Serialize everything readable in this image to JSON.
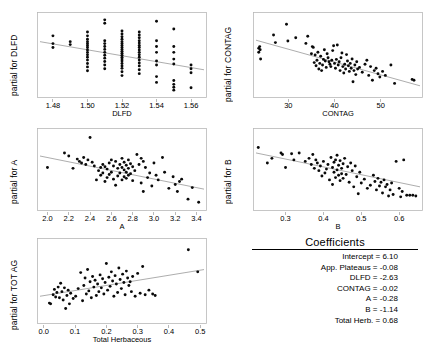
{
  "figure": {
    "width": 428,
    "height": 356,
    "background": "#ffffff",
    "point_color": "#0a0a0a",
    "line_color": "#8a8a8a",
    "frame_color": "#b9b9b9"
  },
  "coefficients": {
    "title": "Coefficients",
    "rows": [
      {
        "label": "Intercept = 6.10"
      },
      {
        "label": "App. Plateaus = -0.08"
      },
      {
        "label": "DLFD = -2.63"
      },
      {
        "label": "CONTAG = -0.02"
      },
      {
        "label": "A = -0.28"
      },
      {
        "label": "B = -1.14"
      },
      {
        "label": "Total Herb. = 0.68"
      }
    ]
  },
  "chart_data": [
    {
      "id": "dlfd",
      "type": "scatter",
      "title": "",
      "ylabel": "partial for DLFD",
      "xlabel": "DLFD",
      "xlim": [
        1.4725,
        1.5675
      ],
      "ylim": [
        -0.6,
        1.05
      ],
      "xticks": [
        1.48,
        1.5,
        1.52,
        1.54,
        1.56
      ],
      "xticklabels": [
        "1.48",
        "1.50",
        "1.52",
        "1.54",
        "1.56"
      ],
      "yticks": [],
      "yticklabels": [],
      "grid": false,
      "legend": "none",
      "fit": {
        "x": [
          1.4725,
          1.5675
        ],
        "y": [
          0.5,
          -0.08
        ]
      },
      "x": [
        1.48,
        1.48,
        1.48,
        1.49,
        1.49,
        1.5,
        1.5,
        1.5,
        1.5,
        1.5,
        1.5,
        1.5,
        1.5,
        1.5,
        1.5,
        1.5,
        1.5,
        1.5,
        1.5,
        1.5,
        1.51,
        1.51,
        1.51,
        1.51,
        1.51,
        1.51,
        1.51,
        1.51,
        1.51,
        1.51,
        1.51,
        1.51,
        1.52,
        1.52,
        1.52,
        1.52,
        1.52,
        1.52,
        1.52,
        1.52,
        1.52,
        1.52,
        1.52,
        1.52,
        1.52,
        1.52,
        1.52,
        1.52,
        1.52,
        1.52,
        1.52,
        1.52,
        1.53,
        1.53,
        1.53,
        1.53,
        1.53,
        1.53,
        1.53,
        1.53,
        1.53,
        1.53,
        1.53,
        1.53,
        1.53,
        1.53,
        1.53,
        1.53,
        1.54,
        1.54,
        1.54,
        1.54,
        1.54,
        1.54,
        1.54,
        1.54,
        1.55,
        1.55,
        1.55,
        1.55,
        1.55,
        1.55,
        1.55,
        1.55,
        1.55,
        1.56,
        1.56,
        1.56,
        1.56
      ],
      "y": [
        0.62,
        0.46,
        0.38,
        0.5,
        0.44,
        0.7,
        0.62,
        0.55,
        0.5,
        0.46,
        0.42,
        0.38,
        0.33,
        0.28,
        0.23,
        0.18,
        0.12,
        0.05,
        -0.02,
        -0.1,
        0.95,
        0.88,
        0.52,
        0.46,
        0.4,
        0.34,
        0.28,
        0.22,
        0.16,
        0.09,
        0.02,
        -0.06,
        0.72,
        0.66,
        0.6,
        0.55,
        0.5,
        0.46,
        0.42,
        0.38,
        0.34,
        0.3,
        0.26,
        0.22,
        0.18,
        0.14,
        0.1,
        0.05,
        0.0,
        -0.05,
        -0.12,
        -0.2,
        0.7,
        0.64,
        0.58,
        0.52,
        0.47,
        0.42,
        0.38,
        0.33,
        0.28,
        0.23,
        0.18,
        0.12,
        0.06,
        0.0,
        -0.08,
        -0.16,
        0.92,
        0.52,
        0.4,
        0.28,
        0.1,
        0.02,
        -0.22,
        -0.34,
        0.76,
        0.4,
        0.28,
        0.14,
        0.04,
        -0.3,
        -0.38,
        -0.44,
        -0.5,
        0.02,
        -0.06,
        -0.14,
        -0.45
      ]
    },
    {
      "id": "contag",
      "type": "scatter",
      "title": "",
      "ylabel": "partial for CONTAG",
      "xlabel": "CONTAG",
      "xlim": [
        23.0,
        58.5
      ],
      "ylim": [
        -0.95,
        1.05
      ],
      "xticks": [
        30,
        40,
        50
      ],
      "xticklabels": [
        "30",
        "40",
        "50"
      ],
      "yticks": [],
      "yticklabels": [],
      "grid": false,
      "legend": "none",
      "fit": {
        "x": [
          23.0,
          58.5
        ],
        "y": [
          0.42,
          -0.72
        ]
      },
      "x": [
        23.6,
        23.6,
        23.8,
        23.9,
        24.0,
        26.8,
        27.2,
        29.6,
        29.9,
        31.6,
        33.8,
        34.2,
        35.0,
        35.2,
        35.4,
        35.6,
        35.8,
        36.0,
        36.2,
        36.4,
        36.6,
        36.8,
        37.0,
        37.2,
        37.4,
        37.6,
        37.8,
        38.0,
        38.2,
        38.4,
        38.6,
        38.8,
        39.0,
        39.2,
        39.4,
        39.6,
        39.8,
        40.0,
        40.2,
        40.4,
        40.6,
        40.8,
        41.0,
        41.2,
        41.4,
        41.6,
        41.8,
        42.0,
        42.2,
        42.4,
        42.6,
        42.8,
        43.0,
        43.2,
        43.4,
        43.6,
        43.8,
        44.0,
        44.2,
        44.4,
        44.6,
        44.8,
        45.0,
        45.4,
        46.0,
        46.6,
        47.0,
        47.4,
        47.8,
        48.2,
        48.6,
        49.0,
        49.4,
        49.8,
        50.4,
        51.0,
        52.2,
        53.0,
        56.8,
        57.2
      ],
      "y": [
        0.22,
        0.12,
        0.26,
        0.18,
        -0.05,
        0.55,
        0.36,
        0.82,
        0.4,
        0.48,
        0.34,
        0.52,
        0.08,
        0.26,
        0.24,
        -0.14,
        0.05,
        -0.22,
        -0.08,
        0.12,
        -0.3,
        -0.16,
        0.02,
        -0.34,
        -0.2,
        -0.06,
        0.18,
        -0.1,
        -0.26,
        0.08,
        -0.02,
        -0.12,
        -0.18,
        -0.24,
        -0.08,
        0.16,
        0.28,
        -0.16,
        -0.28,
        -0.06,
        0.3,
        -0.2,
        -0.12,
        -0.34,
        -0.02,
        0.1,
        -0.24,
        -0.4,
        -0.18,
        -0.3,
        0.06,
        -0.1,
        -0.22,
        -0.36,
        -0.16,
        -0.28,
        -0.05,
        -0.62,
        -0.34,
        -0.2,
        -0.44,
        -0.12,
        -0.3,
        -0.26,
        -0.38,
        -0.18,
        -0.08,
        -0.46,
        -0.24,
        -0.58,
        -0.34,
        -0.28,
        -0.42,
        -0.5,
        -0.36,
        -0.46,
        -0.2,
        -0.66,
        -0.56,
        -0.58
      ]
    },
    {
      "id": "a",
      "type": "scatter",
      "title": "",
      "ylabel": "partial for A",
      "xlabel": "A",
      "xlim": [
        1.93,
        3.47
      ],
      "ylim": [
        -0.95,
        1.05
      ],
      "xticks": [
        2.0,
        2.2,
        2.4,
        2.6,
        2.8,
        3.0,
        3.2,
        3.4
      ],
      "xticklabels": [
        "2.0",
        "2.2",
        "2.4",
        "2.6",
        "2.8",
        "3.0",
        "3.2",
        "3.4"
      ],
      "yticks": [],
      "yticklabels": [],
      "grid": false,
      "legend": "none",
      "fit": {
        "x": [
          1.93,
          3.47
        ],
        "y": [
          0.4,
          -0.46
        ]
      },
      "x": [
        2.0,
        2.16,
        2.2,
        2.24,
        2.28,
        2.3,
        2.32,
        2.34,
        2.36,
        2.38,
        2.4,
        2.42,
        2.44,
        2.46,
        2.48,
        2.5,
        2.5,
        2.52,
        2.52,
        2.54,
        2.54,
        2.56,
        2.56,
        2.58,
        2.58,
        2.6,
        2.6,
        2.62,
        2.62,
        2.64,
        2.64,
        2.66,
        2.66,
        2.68,
        2.68,
        2.7,
        2.7,
        2.7,
        2.72,
        2.72,
        2.72,
        2.74,
        2.74,
        2.74,
        2.76,
        2.76,
        2.76,
        2.78,
        2.78,
        2.8,
        2.8,
        2.82,
        2.84,
        2.86,
        2.88,
        2.88,
        2.9,
        2.9,
        2.92,
        2.94,
        2.96,
        2.98,
        3.0,
        3.02,
        3.04,
        3.08,
        3.1,
        3.14,
        3.18,
        3.2,
        3.22,
        3.24,
        3.26,
        3.32,
        3.36,
        3.42
      ],
      "y": [
        0.1,
        0.48,
        0.4,
        0.08,
        0.32,
        0.26,
        0.22,
        0.36,
        0.18,
        0.3,
        0.88,
        0.24,
        0.14,
        -0.22,
        0.02,
        0.1,
        -0.1,
        0.18,
        -0.04,
        0.12,
        -0.26,
        0.06,
        -0.16,
        0.22,
        -0.08,
        0.3,
        -0.02,
        0.14,
        -0.2,
        0.26,
        -0.36,
        0.08,
        -0.12,
        0.18,
        -0.04,
        0.34,
        0.1,
        -0.22,
        0.24,
        0.04,
        -0.14,
        0.16,
        -0.02,
        -0.18,
        0.3,
        0.08,
        -0.1,
        0.2,
        -0.06,
        0.12,
        -0.24,
        0.02,
        0.44,
        0.18,
        0.34,
        -0.3,
        0.26,
        -0.52,
        0.1,
        -0.16,
        -0.04,
        -0.38,
        0.22,
        -0.1,
        -0.22,
        0.36,
        -0.02,
        -0.44,
        -0.14,
        -0.34,
        -0.52,
        -0.26,
        -0.2,
        -0.72,
        -0.42,
        -0.8
      ]
    },
    {
      "id": "b",
      "type": "scatter",
      "title": "",
      "ylabel": "partial for B",
      "xlabel": "B",
      "xlim": [
        0.222,
        0.655
      ],
      "ylim": [
        -0.95,
        1.05
      ],
      "xticks": [
        0.3,
        0.4,
        0.5,
        0.6
      ],
      "xticklabels": [
        "0.3",
        "0.4",
        "0.5",
        "0.6"
      ],
      "yticks": [],
      "yticklabels": [],
      "grid": false,
      "legend": "none",
      "fit": {
        "x": [
          0.222,
          0.655
        ],
        "y": [
          0.48,
          -0.4
        ]
      },
      "x": [
        0.228,
        0.252,
        0.264,
        0.288,
        0.292,
        0.3,
        0.316,
        0.322,
        0.336,
        0.352,
        0.362,
        0.368,
        0.372,
        0.376,
        0.38,
        0.384,
        0.388,
        0.392,
        0.396,
        0.4,
        0.404,
        0.408,
        0.412,
        0.416,
        0.42,
        0.424,
        0.424,
        0.428,
        0.428,
        0.432,
        0.432,
        0.436,
        0.436,
        0.44,
        0.44,
        0.444,
        0.444,
        0.448,
        0.448,
        0.452,
        0.452,
        0.456,
        0.46,
        0.464,
        0.468,
        0.472,
        0.476,
        0.48,
        0.484,
        0.488,
        0.492,
        0.496,
        0.5,
        0.508,
        0.516,
        0.524,
        0.532,
        0.536,
        0.54,
        0.544,
        0.548,
        0.552,
        0.556,
        0.56,
        0.564,
        0.568,
        0.572,
        0.576,
        0.58,
        0.584,
        0.592,
        0.6,
        0.604,
        0.608,
        0.612,
        0.62,
        0.628,
        0.636,
        0.644
      ],
      "y": [
        0.62,
        0.22,
        0.34,
        0.48,
        0.44,
        0.1,
        0.46,
        0.3,
        0.48,
        0.26,
        0.34,
        0.18,
        0.44,
        0.08,
        0.3,
        0.22,
        0.02,
        0.14,
        -0.12,
        0.26,
        -0.04,
        0.06,
        0.18,
        -0.22,
        0.36,
        0.1,
        -0.34,
        0.24,
        -0.02,
        0.3,
        -0.16,
        0.42,
        0.04,
        0.16,
        -0.1,
        0.28,
        -0.24,
        0.08,
        -0.06,
        0.2,
        -0.18,
        0.34,
        -0.08,
        0.12,
        -0.28,
        0.22,
        0.02,
        -0.4,
        0.14,
        -0.14,
        -0.58,
        -0.02,
        -0.3,
        -0.2,
        -0.44,
        -0.36,
        -0.1,
        -0.26,
        -0.48,
        -0.18,
        -0.38,
        -0.28,
        -0.56,
        -0.22,
        -0.4,
        -0.34,
        -0.64,
        -0.48,
        -0.3,
        -0.6,
        0.26,
        -0.44,
        -0.66,
        -0.52,
        0.3,
        -0.62,
        -0.62,
        -0.62,
        -0.64
      ]
    },
    {
      "id": "totag",
      "type": "scatter",
      "title": "",
      "ylabel": "partial for TOT AG",
      "xlabel": "Total Herbaceous",
      "xlim": [
        -0.012,
        0.512
      ],
      "ylim": [
        -0.95,
        1.15
      ],
      "xticks": [
        0.0,
        0.1,
        0.2,
        0.3,
        0.4,
        0.5
      ],
      "xticklabels": [
        "0.0",
        "0.1",
        "0.2",
        "0.3",
        "0.4",
        "0.5"
      ],
      "yticks": [],
      "yticklabels": [],
      "grid": false,
      "legend": "none",
      "fit": {
        "x": [
          -0.012,
          0.512
        ],
        "y": [
          -0.3,
          0.4
        ]
      },
      "x": [
        0.018,
        0.022,
        0.03,
        0.034,
        0.038,
        0.042,
        0.046,
        0.05,
        0.054,
        0.058,
        0.062,
        0.066,
        0.07,
        0.074,
        0.078,
        0.082,
        0.086,
        0.094,
        0.102,
        0.11,
        0.118,
        0.124,
        0.128,
        0.132,
        0.136,
        0.14,
        0.144,
        0.148,
        0.152,
        0.156,
        0.16,
        0.164,
        0.168,
        0.172,
        0.176,
        0.18,
        0.184,
        0.188,
        0.192,
        0.196,
        0.2,
        0.204,
        0.208,
        0.212,
        0.216,
        0.22,
        0.224,
        0.228,
        0.232,
        0.236,
        0.24,
        0.244,
        0.248,
        0.252,
        0.256,
        0.26,
        0.264,
        0.268,
        0.272,
        0.276,
        0.28,
        0.284,
        0.292,
        0.3,
        0.308,
        0.316,
        0.324,
        0.336,
        0.348,
        0.356,
        0.462,
        0.492
      ],
      "y": [
        -0.48,
        -0.5,
        -0.26,
        -0.12,
        -0.32,
        -0.2,
        -0.06,
        -0.34,
        0.04,
        -0.18,
        -0.4,
        -0.08,
        -0.62,
        -0.28,
        -0.14,
        -0.5,
        -0.22,
        -0.36,
        -0.3,
        -0.1,
        0.32,
        -0.42,
        -0.02,
        0.18,
        -0.24,
        0.4,
        -0.16,
        0.08,
        -0.34,
        0.22,
        -0.06,
        0.12,
        -0.28,
        0.02,
        -0.18,
        0.26,
        -0.08,
        0.16,
        -0.24,
        0.06,
        0.56,
        -0.14,
        0.2,
        -0.04,
        0.34,
        0.1,
        -0.3,
        0.24,
        0.02,
        -0.2,
        0.44,
        0.14,
        -0.1,
        0.28,
        0.06,
        -0.26,
        0.36,
        0.18,
        -0.02,
        0.08,
        -0.18,
        0.22,
        -0.3,
        0.3,
        -0.22,
        0.48,
        -0.26,
        -0.14,
        -0.24,
        -0.28,
        0.92,
        0.34
      ]
    }
  ]
}
